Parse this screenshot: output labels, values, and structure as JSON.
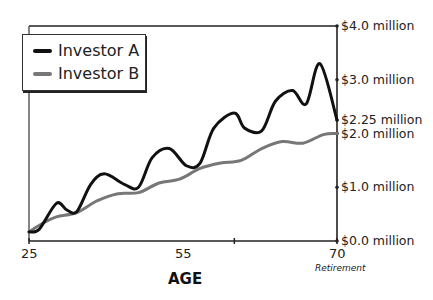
{
  "chart_data": {
    "type": "line",
    "title": "",
    "xlabel": "AGE",
    "ylabel": "",
    "x_ticks": [
      {
        "value": 25,
        "label": "25"
      },
      {
        "value": 55,
        "label": "55"
      },
      {
        "value": 70,
        "label": "70",
        "sublabel": "Retirement"
      }
    ],
    "y_ticks": [
      {
        "value": 0.0,
        "label": "$0.0 million"
      },
      {
        "value": 1.0,
        "label": "$1.0 million"
      },
      {
        "value": 2.0,
        "label": "$2.0 million"
      },
      {
        "value": 2.25,
        "label": "$2.25 million"
      },
      {
        "value": 3.0,
        "label": "$3.0 million"
      },
      {
        "value": 4.0,
        "label": "$4.0 million"
      }
    ],
    "xlim": [
      25,
      70
    ],
    "ylim": [
      0,
      4.0
    ],
    "y_axis_position": "right",
    "grid": false,
    "legend_position": "top-left",
    "series": [
      {
        "name": "Investor A",
        "color": "#111111",
        "x": [
          25,
          26.5,
          29,
          30.5,
          32,
          34,
          36,
          39,
          41,
          43,
          45.5,
          48,
          50,
          52,
          55,
          56.5,
          59,
          61,
          63.5,
          65.5,
          67.5,
          70
        ],
        "y": [
          0.17,
          0.22,
          0.7,
          0.58,
          0.55,
          1.05,
          1.25,
          1.05,
          1.0,
          1.55,
          1.72,
          1.4,
          1.45,
          2.1,
          2.38,
          2.1,
          2.05,
          2.6,
          2.8,
          2.55,
          3.3,
          2.25
        ]
      },
      {
        "name": "Investor B",
        "color": "#777777",
        "x": [
          25,
          27,
          29,
          32,
          35,
          38,
          41,
          44,
          47,
          50,
          53,
          56,
          59,
          62,
          65,
          68,
          70
        ],
        "y": [
          0.17,
          0.33,
          0.45,
          0.53,
          0.75,
          0.88,
          0.9,
          1.08,
          1.15,
          1.35,
          1.45,
          1.5,
          1.72,
          1.85,
          1.82,
          1.98,
          2.0
        ]
      }
    ]
  },
  "legend": {
    "items": [
      {
        "label": "Investor A",
        "color": "#111111"
      },
      {
        "label": "Investor B",
        "color": "#777777"
      }
    ]
  },
  "axes": {
    "x_title": "AGE",
    "x_labels": [
      "25",
      "55",
      "70"
    ],
    "x_sublabel": "Retirement",
    "y_labels": [
      "$4.0 million",
      "$3.0 million",
      "$2.25 million",
      "$2.0 million",
      "$1.0 million",
      "$0.0 million"
    ]
  }
}
